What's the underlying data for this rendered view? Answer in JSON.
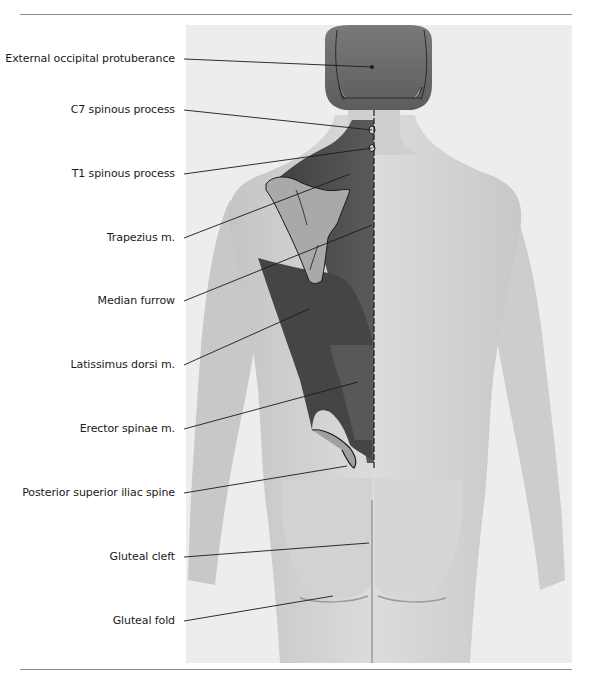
{
  "figure": {
    "colors": {
      "background": "#ffffff",
      "photo_bg": "#ededed",
      "skin_light": "#d9d9d9",
      "skin_shadow": "#b5b5b5",
      "hair": "#6a6a6a",
      "muscle_dark": "#4a4a4a",
      "muscle_mid": "#6e6e6e",
      "bone": "#a8a8a8",
      "rule": "#8a8a8a",
      "leader": "#1a1a1a"
    },
    "labels": [
      {
        "id": "external-occipital-protuberance",
        "text": "External occipital protuberance",
        "y": 59,
        "target": [
          372,
          67
        ]
      },
      {
        "id": "c7-spinous-process",
        "text": "C7 spinous process",
        "y": 110,
        "target": [
          372,
          130
        ]
      },
      {
        "id": "t1-spinous-process",
        "text": "T1 spinous process",
        "y": 174,
        "target": [
          372,
          148
        ]
      },
      {
        "id": "trapezius",
        "text": "Trapezius m.",
        "y": 238,
        "target": [
          350,
          174
        ]
      },
      {
        "id": "median-furrow",
        "text": "Median furrow",
        "y": 301,
        "target": [
          372,
          225
        ]
      },
      {
        "id": "latissimus-dorsi",
        "text": "Latissimus dorsi m.",
        "y": 365,
        "target": [
          309,
          309
        ]
      },
      {
        "id": "erector-spinae",
        "text": "Erector spinae m.",
        "y": 429,
        "target": [
          358,
          382
        ]
      },
      {
        "id": "posterior-superior-iliac-spine",
        "text": "Posterior superior iliac spine",
        "y": 493,
        "target": [
          347,
          466
        ]
      },
      {
        "id": "gluteal-cleft",
        "text": "Gluteal cleft",
        "y": 557,
        "target": [
          369,
          543
        ]
      },
      {
        "id": "gluteal-fold",
        "text": "Gluteal fold",
        "y": 621,
        "target": [
          333,
          596
        ]
      }
    ]
  }
}
